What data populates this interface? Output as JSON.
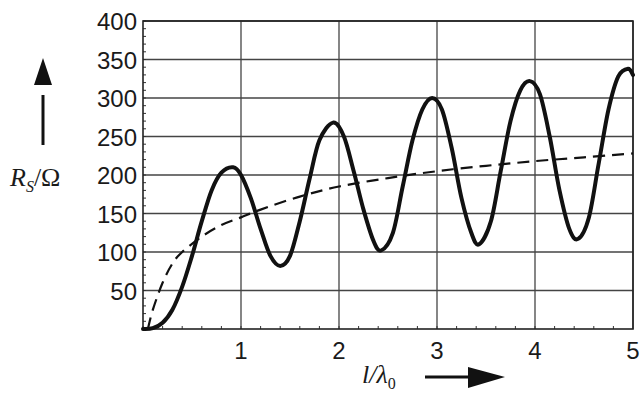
{
  "chart_data": {
    "type": "line",
    "title": "",
    "xlabel": "l/λ0",
    "ylabel": "R_S/Ω",
    "xlim": [
      0,
      5
    ],
    "ylim": [
      0,
      400
    ],
    "grid": true,
    "legend": "none",
    "x_ticks": [
      "1",
      "2",
      "3",
      "4",
      "5"
    ],
    "y_ticks": [
      "50",
      "100",
      "150",
      "200",
      "250",
      "300",
      "350",
      "400"
    ],
    "series": [
      {
        "name": "R_S (solid)",
        "style": "solid",
        "x": [
          0,
          0.1,
          0.2,
          0.3,
          0.4,
          0.5,
          0.6,
          0.7,
          0.8,
          0.92,
          1.0,
          1.1,
          1.2,
          1.3,
          1.4,
          1.5,
          1.6,
          1.7,
          1.8,
          1.94,
          2.05,
          2.15,
          2.25,
          2.35,
          2.43,
          2.55,
          2.65,
          2.75,
          2.85,
          2.95,
          3.05,
          3.15,
          3.25,
          3.35,
          3.43,
          3.55,
          3.65,
          3.75,
          3.85,
          3.95,
          4.05,
          4.15,
          4.25,
          4.35,
          4.44,
          4.55,
          4.65,
          4.75,
          4.85,
          4.95,
          5.0
        ],
        "values": [
          0,
          1,
          8,
          25,
          55,
          95,
          140,
          180,
          203,
          210,
          200,
          170,
          130,
          95,
          82,
          95,
          140,
          195,
          245,
          268,
          250,
          205,
          155,
          115,
          102,
          125,
          185,
          245,
          285,
          300,
          285,
          235,
          170,
          125,
          110,
          140,
          205,
          270,
          310,
          322,
          305,
          250,
          180,
          130,
          117,
          145,
          215,
          285,
          328,
          338,
          330
        ]
      },
      {
        "name": "Reference (dashed)",
        "style": "dashed",
        "x": [
          0.05,
          0.1,
          0.2,
          0.3,
          0.4,
          0.6,
          0.8,
          1.0,
          1.2,
          1.6,
          2.0,
          2.5,
          3.0,
          3.5,
          4.0,
          4.5,
          5.0
        ],
        "values": [
          0,
          25,
          60,
          85,
          100,
          120,
          135,
          145,
          155,
          172,
          185,
          196,
          205,
          212,
          218,
          223,
          228
        ]
      }
    ],
    "annotations": [
      "↑ arrow beside y-axis label",
      "→ arrow beside x-axis label"
    ]
  },
  "axes": {
    "y_label_main": "R",
    "y_label_sub": "S",
    "y_label_rest": "/Ω",
    "x_label_main": "l/λ",
    "x_label_sub": "0"
  }
}
